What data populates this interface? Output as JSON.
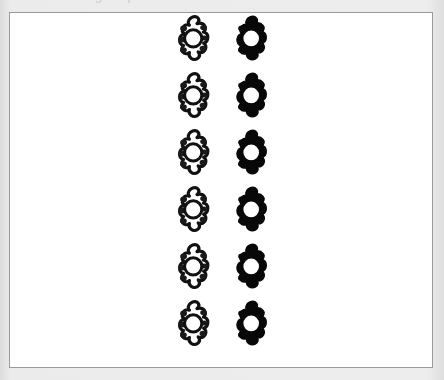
{
  "page": {
    "background_color": "#e9e9e9",
    "width": 444,
    "height": 380,
    "clipped_header_text": "anatomical figure plate"
  },
  "figure": {
    "frame": {
      "border_color": "#9a9a9a",
      "fill_color": "#ffffff",
      "left": 9,
      "top": 12,
      "width": 424,
      "height": 356
    },
    "caption": "",
    "columns": [
      {
        "id": "left-column",
        "style": "outline",
        "label": "unfilled vertebra outline",
        "center_x": 186,
        "fill_color": "#ffffff",
        "stroke_color": "#111111",
        "foramen_color": "#ffffff"
      },
      {
        "id": "right-column",
        "style": "solid",
        "label": "solid black vertebra",
        "center_x": 244,
        "fill_color": "#080808",
        "stroke_color": "#080808",
        "foramen_color": "#ffffff"
      }
    ],
    "rows": [
      {
        "index": 1,
        "top": 2
      },
      {
        "index": 2,
        "top": 59
      },
      {
        "index": 3,
        "top": 116
      },
      {
        "index": 4,
        "top": 173
      },
      {
        "index": 5,
        "top": 230
      },
      {
        "index": 6,
        "top": 287
      }
    ],
    "row_count": 6,
    "column_count": 2,
    "shape_name": "vertebra-superior-view"
  }
}
